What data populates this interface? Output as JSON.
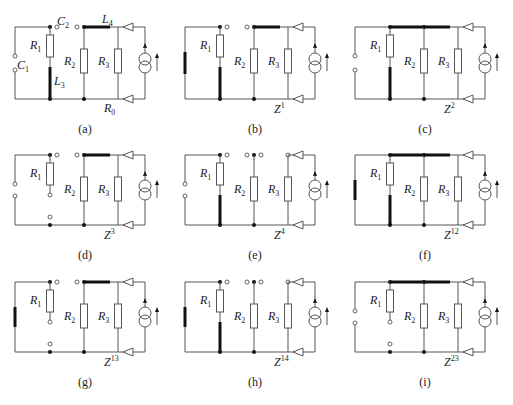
{
  "figure": {
    "panels": [
      {
        "id": "a",
        "caption": "(a)",
        "z_label": "",
        "z_sup": "",
        "extra": {
          "C1": "C",
          "C1_sub": "1",
          "C2": "C",
          "C2_sub": "2",
          "L3": "L",
          "L3_sub": "3",
          "L4": "L",
          "L4_sub": "4",
          "R0": "R",
          "R0_sub": "0"
        }
      },
      {
        "id": "b",
        "caption": "(b)",
        "z_label": "Z",
        "z_sup": "1"
      },
      {
        "id": "c",
        "caption": "(c)",
        "z_label": "Z",
        "z_sup": "2"
      },
      {
        "id": "d",
        "caption": "(d)",
        "z_label": "Z",
        "z_sup": "3"
      },
      {
        "id": "e",
        "caption": "(e)",
        "z_label": "Z",
        "z_sup": "4"
      },
      {
        "id": "f",
        "caption": "(f)",
        "z_label": "Z",
        "z_sup": "12"
      },
      {
        "id": "g",
        "caption": "(g)",
        "z_label": "Z",
        "z_sup": "13"
      },
      {
        "id": "h",
        "caption": "(h)",
        "z_label": "Z",
        "z_sup": "14"
      },
      {
        "id": "i",
        "caption": "(i)",
        "z_label": "Z",
        "z_sup": "23"
      }
    ],
    "resistor_labels": {
      "R1": "R",
      "R1_sub": "1",
      "R2": "R",
      "R2_sub": "2",
      "R3": "R",
      "R3_sub": "3"
    },
    "colors": {
      "wire": "#555555",
      "thick": "#111111",
      "text": "#222222"
    }
  }
}
